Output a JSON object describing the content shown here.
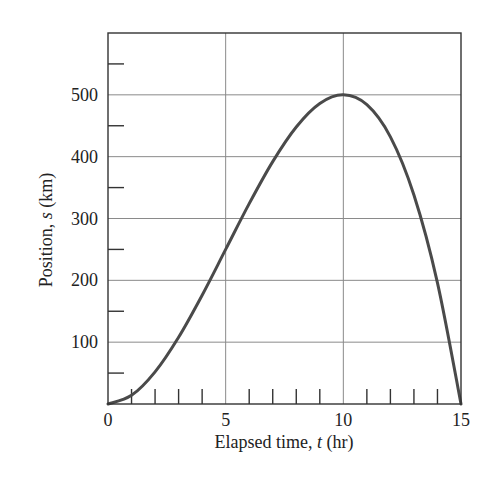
{
  "chart_data": {
    "type": "line",
    "title": "",
    "xlabel": "Elapsed time, t (hr)",
    "xlabel_parts": {
      "prefix": "Elapsed time, ",
      "var": "t",
      "suffix": " (hr)"
    },
    "ylabel": "Position, s (km)",
    "ylabel_parts": {
      "prefix": "Position, ",
      "var": "s",
      "suffix": " (km)"
    },
    "xlim": [
      0,
      15
    ],
    "ylim": [
      0,
      600
    ],
    "x_major_ticks": [
      0,
      5,
      10,
      15
    ],
    "x_tick_labels": [
      "0",
      "5",
      "10",
      "15"
    ],
    "x_minor_ticks": [
      1,
      2,
      3,
      4,
      6,
      7,
      8,
      9,
      11,
      12,
      13,
      14
    ],
    "y_major_ticks": [
      100,
      200,
      300,
      400,
      500
    ],
    "y_tick_labels": [
      "100",
      "200",
      "300",
      "400",
      "500"
    ],
    "y_minor_ticks": [
      50,
      150,
      250,
      350,
      450,
      550
    ],
    "grid": {
      "vertical": [
        5,
        10
      ],
      "horizontal": [
        100,
        200,
        300,
        400,
        500
      ]
    },
    "legend": null,
    "series": [
      {
        "name": "s(t)",
        "x": [
          0,
          1,
          2,
          3,
          4,
          5,
          6,
          7,
          8,
          9,
          10,
          11,
          12,
          13,
          14,
          15
        ],
        "values": [
          0,
          14,
          52,
          108,
          176,
          250,
          324,
          392,
          448,
          486,
          500,
          484,
          432,
          338,
          196,
          0
        ]
      }
    ],
    "annotations": []
  }
}
